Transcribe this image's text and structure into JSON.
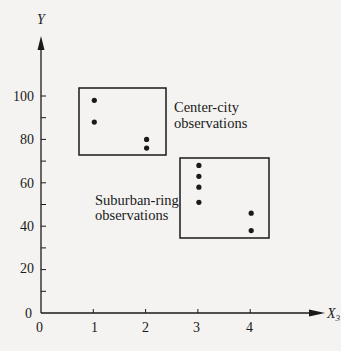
{
  "chart_data": {
    "type": "scatter",
    "title": "",
    "xlabel": "X",
    "xlabel_subscript": "3",
    "ylabel": "Y",
    "xlim": [
      0,
      4.6
    ],
    "ylim": [
      0,
      130
    ],
    "x_ticks": [
      0,
      1,
      2,
      3,
      4
    ],
    "x_tick_labels": [
      "0",
      "1",
      "2",
      "3",
      "4"
    ],
    "y_ticks": [
      0,
      20,
      40,
      60,
      80,
      100
    ],
    "y_tick_labels": [
      "0",
      "20",
      "40",
      "60",
      "80",
      "100"
    ],
    "y_minor_ticks": [
      10,
      30,
      50,
      70,
      90
    ],
    "grid": false,
    "legend": null,
    "series": [
      {
        "name": "Center-city observations",
        "points": [
          {
            "x": 1,
            "y": 98
          },
          {
            "x": 1,
            "y": 88
          },
          {
            "x": 2,
            "y": 80
          },
          {
            "x": 2,
            "y": 76
          }
        ],
        "box": {
          "x0": 0.7,
          "x1": 2.4,
          "y0": 72,
          "y1": 103
        }
      },
      {
        "name": "Suburban-ring observations",
        "points": [
          {
            "x": 3,
            "y": 68
          },
          {
            "x": 3,
            "y": 63
          },
          {
            "x": 3,
            "y": 58
          },
          {
            "x": 3,
            "y": 51
          },
          {
            "x": 4,
            "y": 46
          },
          {
            "x": 4,
            "y": 38
          }
        ],
        "box": {
          "x0": 2.7,
          "x1": 4.4,
          "y0": 35,
          "y1": 71
        }
      }
    ],
    "annotations": [
      {
        "text_lines": [
          "Center-city",
          "observations"
        ],
        "near": "center-city box, right side"
      },
      {
        "text_lines": [
          "Suburban-ring",
          "observations"
        ],
        "near": "suburban box, left side"
      }
    ]
  },
  "labels": {
    "y_axis": "Y",
    "x_axis_main": "X",
    "x_axis_sub": "3",
    "center_city_line1": "Center-city",
    "center_city_line2": "observations",
    "suburban_line1": "Suburban-ring",
    "suburban_line2": "observations",
    "origin": "0",
    "x_tick_0": "0",
    "x_tick_1": "1",
    "x_tick_2": "2",
    "x_tick_3": "3",
    "x_tick_4": "4",
    "y_tick_20": "20",
    "y_tick_40": "40",
    "y_tick_60": "60",
    "y_tick_80": "80",
    "y_tick_100": "100"
  }
}
